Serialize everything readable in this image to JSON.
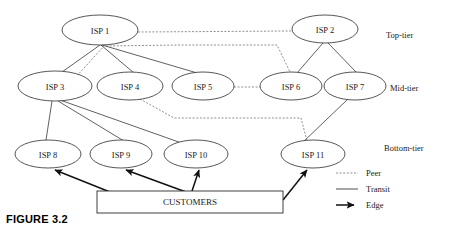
{
  "figure": {
    "caption": "FIGURE 3.2"
  },
  "diagram": {
    "nodes": [
      {
        "id": "isp1",
        "label": "ISP 1",
        "cx": 100,
        "cy": 30,
        "rx": 38,
        "ry": 15,
        "tier": "top"
      },
      {
        "id": "isp2",
        "label": "ISP 2",
        "cx": 325,
        "cy": 29,
        "rx": 33,
        "ry": 14,
        "tier": "top"
      },
      {
        "id": "isp3",
        "label": "ISP 3",
        "cx": 55,
        "cy": 86,
        "rx": 37,
        "ry": 15,
        "tier": "mid"
      },
      {
        "id": "isp4",
        "label": "ISP 4",
        "cx": 130,
        "cy": 86,
        "rx": 33,
        "ry": 14,
        "tier": "mid"
      },
      {
        "id": "isp5",
        "label": "ISP 5",
        "cx": 203,
        "cy": 86,
        "rx": 31,
        "ry": 14,
        "tier": "mid"
      },
      {
        "id": "isp6",
        "label": "ISP 6",
        "cx": 291,
        "cy": 86,
        "rx": 31,
        "ry": 14,
        "tier": "mid"
      },
      {
        "id": "isp7",
        "label": "ISP 7",
        "cx": 355,
        "cy": 86,
        "rx": 31,
        "ry": 14,
        "tier": "mid"
      },
      {
        "id": "isp8",
        "label": "ISP 8",
        "cx": 48,
        "cy": 154,
        "rx": 33,
        "ry": 14,
        "tier": "bottom"
      },
      {
        "id": "isp9",
        "label": "ISP 9",
        "cx": 121,
        "cy": 154,
        "rx": 31,
        "ry": 14,
        "tier": "bottom"
      },
      {
        "id": "isp10",
        "label": "ISP 10",
        "cx": 196,
        "cy": 154,
        "rx": 32,
        "ry": 14,
        "tier": "bottom"
      },
      {
        "id": "isp11",
        "label": "ISP 11",
        "cx": 313,
        "cy": 154,
        "rx": 32,
        "ry": 14,
        "tier": "bottom"
      }
    ],
    "customers_box": {
      "label": "CUSTOMERS",
      "x": 97,
      "y": 191,
      "width": 186,
      "height": 22
    },
    "tier_labels": [
      {
        "id": "top",
        "label": "Top-tier",
        "x": 386,
        "y": 35
      },
      {
        "id": "mid",
        "label": "Mid-tier",
        "x": 390,
        "y": 88
      },
      {
        "id": "bottom",
        "label": "Bottom-tier",
        "x": 384,
        "y": 148
      }
    ],
    "transit_links": [
      {
        "from": "isp1",
        "to": "isp3",
        "path": "M 100,45 L 62,72"
      },
      {
        "from": "isp1",
        "to": "isp4",
        "path": "M 101,45 L 134,73"
      },
      {
        "from": "isp1",
        "to": "isp5",
        "path": "M 102,45 L 221,80"
      },
      {
        "from": "isp2",
        "to": "isp6",
        "path": "M 323,43 L 297,73"
      },
      {
        "from": "isp2",
        "to": "isp7",
        "path": "M 328,43 L 357,73"
      },
      {
        "from": "isp3",
        "to": "isp8",
        "path": "M 52,101 L 46,140"
      },
      {
        "from": "isp3",
        "to": "isp9",
        "path": "M 58,101 L 124,141"
      },
      {
        "from": "isp3",
        "to": "isp10",
        "path": "M 60,100 L 190,146"
      },
      {
        "from": "isp7",
        "to": "isp11",
        "path": "M 348,99 L 302,143"
      }
    ],
    "peer_links": [
      {
        "from": "isp1",
        "to": "isp2",
        "path": "M 138,32 L 292,31"
      },
      {
        "from": "isp3",
        "to": "isp1",
        "path": "M 55,100 L 104,46"
      },
      {
        "from": "isp1",
        "to": "isp6",
        "path": "M 106,46 L 180,45 L 277,45 L 290,72"
      },
      {
        "from": "isp5",
        "to": "isp6",
        "path": "M 234,87 L 260,87"
      },
      {
        "from": "isp4",
        "to": "isp11",
        "path": "M 140,99 L 174,118 L 301,118 L 307,141"
      }
    ],
    "edge_links": [
      {
        "from": "customers",
        "to": "isp8",
        "path": "M 110,192 L 55,170"
      },
      {
        "from": "customers",
        "to": "isp9",
        "path": "M 186,192 L 126,170"
      },
      {
        "from": "customers",
        "to": "isp10",
        "path": "M 192,191 L 199,170"
      },
      {
        "from": "customers",
        "to": "isp11",
        "path": "M 283,200 L 307,170"
      }
    ]
  },
  "legend": {
    "items": [
      {
        "id": "peer",
        "label": "Peer",
        "style": "dashed",
        "x": 336,
        "y": 173
      },
      {
        "id": "transit",
        "label": "Transit",
        "style": "solid",
        "x": 336,
        "y": 189
      },
      {
        "id": "edge",
        "label": "Edge",
        "style": "arrow",
        "x": 336,
        "y": 205
      }
    ]
  },
  "colors": {
    "stroke": "#2b2b2b",
    "peer_stroke": "#6b6b6b",
    "edge_stroke": "#111111",
    "text": "#1a1a1a",
    "background": "#ffffff"
  }
}
